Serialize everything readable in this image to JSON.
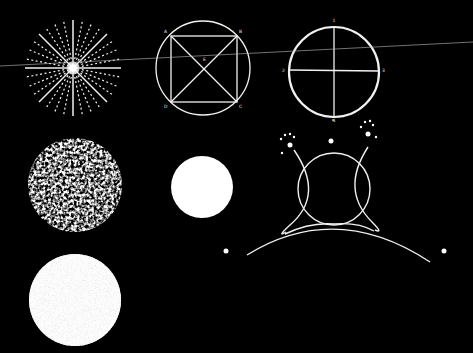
{
  "colors": {
    "background": "#000000",
    "stroke": "#f2f2f2",
    "fill": "#ffffff"
  },
  "figures": {
    "starburst": {
      "center": [
        73,
        68
      ],
      "radius": 48
    },
    "inscribed_square": {
      "center": [
        203,
        68
      ],
      "radius": 47,
      "labels": {
        "a": "A",
        "b": "B",
        "c": "C",
        "d": "D",
        "e": "E"
      }
    },
    "quartered_circle": {
      "center": [
        334,
        72
      ],
      "radius": 45,
      "labels": {
        "top": "1",
        "left": "2",
        "right": "3",
        "bottom": "4"
      }
    },
    "mottled_sphere": {
      "center": [
        75,
        185
      ],
      "radius": 47
    },
    "speckled_sphere": {
      "center": [
        75,
        300
      ],
      "radius": 46
    },
    "solid_disk": {
      "center": [
        202,
        187
      ],
      "radius": 31
    },
    "horned_orb_on_arc": {
      "circle_center": [
        334,
        189
      ],
      "circle_radius": 36
    }
  },
  "guide_line": {
    "from": [
      0,
      66
    ],
    "to": [
      473,
      42
    ]
  }
}
